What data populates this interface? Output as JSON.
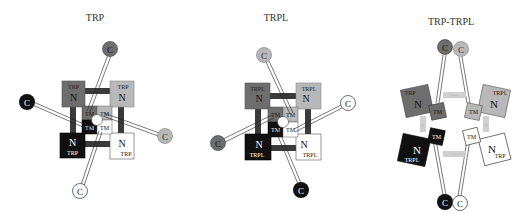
{
  "panels": [
    {
      "title": "TRP",
      "subunit_label": "TRP",
      "n_label": "N",
      "tm_label": "TM",
      "c_label": "C"
    },
    {
      "title": "TRPL",
      "subunit_label": "TRPL",
      "n_label": "N",
      "tm_label": "TM",
      "c_label": "C"
    },
    {
      "title": "TRP-TRPL",
      "subunits": [
        "TRP",
        "TRPL",
        "TRPL",
        "TRP"
      ],
      "n_label": "N",
      "tm_label": "TM",
      "c_label": "C"
    }
  ],
  "colors": {
    "dark_gray": "#6e6e6e",
    "light_gray": "#b8b8b8",
    "black": "#111111",
    "white": "#ffffff",
    "linker": "#3a3a3a",
    "bond": "#cfcfcf"
  }
}
